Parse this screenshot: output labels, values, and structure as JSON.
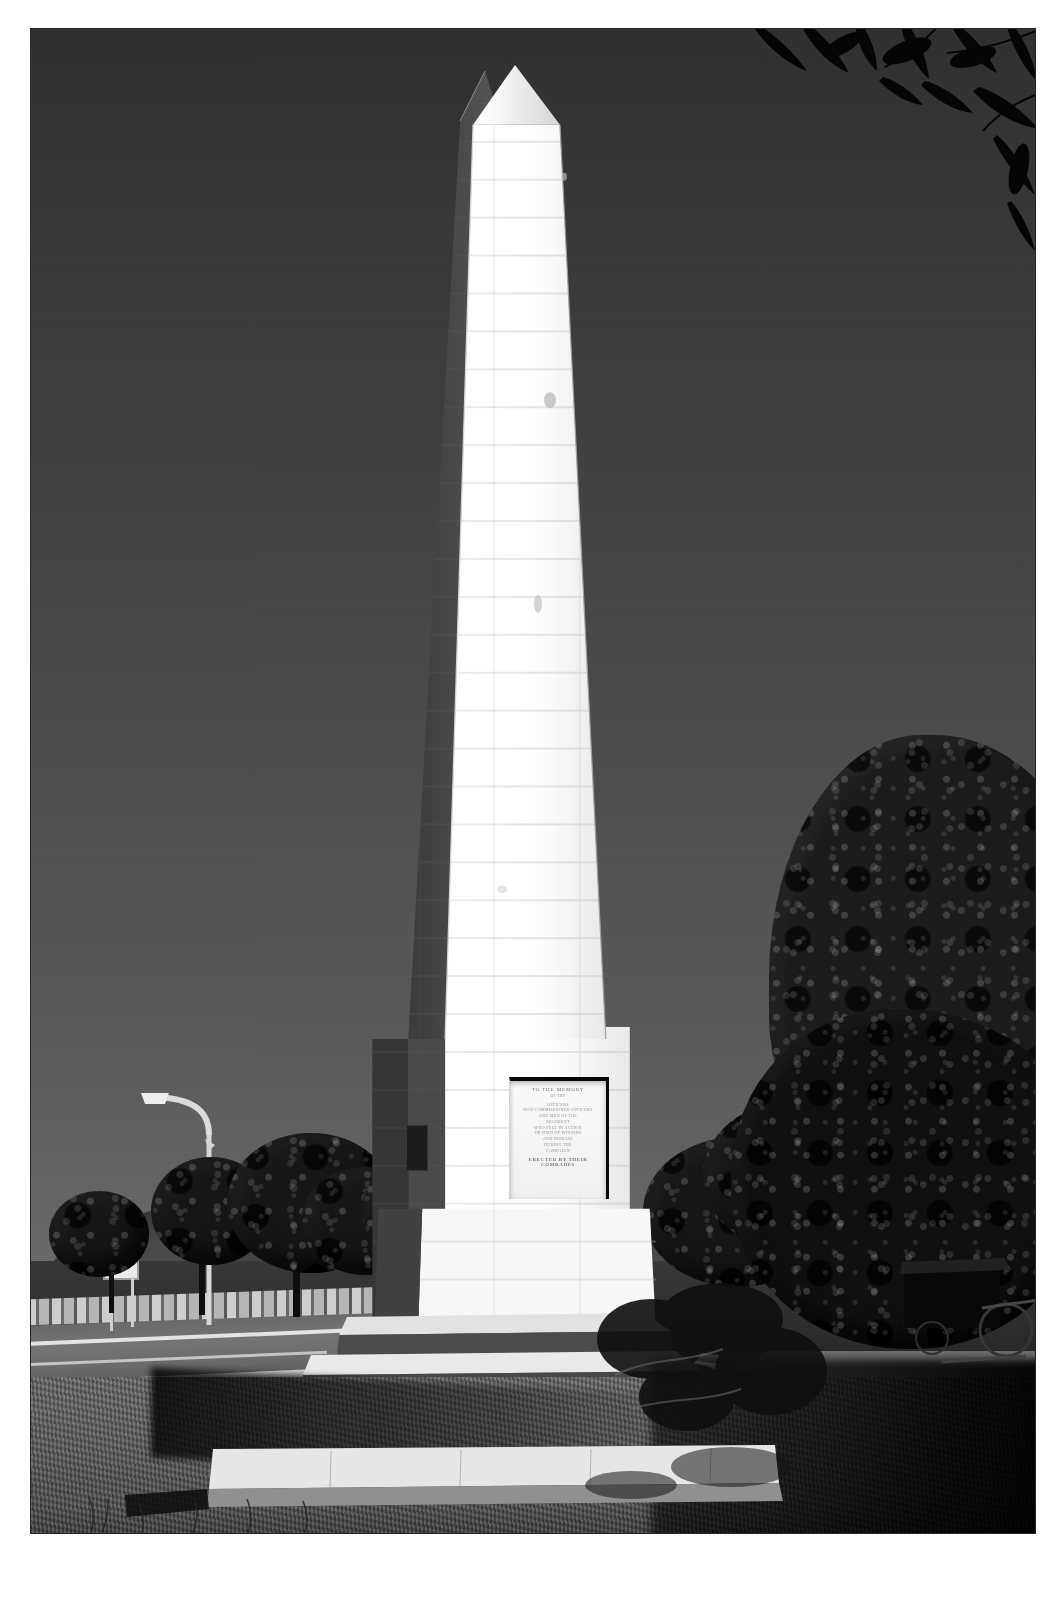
{
  "photo": {
    "title": "Stone obelisk war memorial photograph",
    "medium": "black-and-white halftone print",
    "orientation": "portrait",
    "border_color": "#2b2b2b",
    "background_color": "#ffffff"
  },
  "monument": {
    "name": "obelisk-memorial",
    "description": "Tall tapering ashlar stone obelisk with pyramidal apex",
    "sunlit_face_color": "#f6f6f6",
    "shadow_face_color": "#4a4a4a",
    "apex_label": "pyramidion"
  },
  "inscription": {
    "heading": "TO THE MEMORY",
    "subheading": "OF THE",
    "lines": [
      "OFFICERS",
      "NON-COMMISSIONED OFFICERS",
      "AND MEN OF THE",
      "REGIMENT",
      "WHO FELL IN ACTION",
      "OR DIED OF WOUNDS",
      "AND DISEASE",
      "DURING THE",
      "CAMPAIGN"
    ],
    "footer": "ERECTED BY THEIR COMRADES",
    "legibility": "illegible"
  },
  "signboard": {
    "name": "roadside-signboard",
    "text": "",
    "color": "#e4e4e4"
  },
  "scene": {
    "sky": {
      "label": "clear sky",
      "top_color": "#343434",
      "horizon_color": "#747474"
    },
    "elements": [
      {
        "name": "street-lamp",
        "label": "Street lamp with curved arm"
      },
      {
        "name": "roadway",
        "label": "Two-lane road with painted lane markings"
      },
      {
        "name": "stone-retaining-wall",
        "label": "Low stone retaining wall"
      },
      {
        "name": "hillside",
        "label": "Rolling grassy hill on the horizon"
      },
      {
        "name": "tree-cluster-left",
        "label": "Row of trees beside the road"
      },
      {
        "name": "tree-right",
        "label": "Large leafy tree at right"
      },
      {
        "name": "overhanging-leaves",
        "label": "Eucalyptus foliage overhanging top right"
      },
      {
        "name": "lawn",
        "label": "Mown grass lawn in foreground"
      },
      {
        "name": "stepped-plinth",
        "label": "Tiered stone steps at the monument base"
      },
      {
        "name": "dark-structure-right",
        "label": "Shadowed structure among the trees"
      }
    ],
    "lighting": "Strong low side light; monument front brightly lit, left face in shadow",
    "shadow_direction": "cast to the lower-left"
  },
  "steps": {
    "count": 4,
    "tread_color": "#d9d9d9",
    "riser_color": "#4a4a4a"
  }
}
